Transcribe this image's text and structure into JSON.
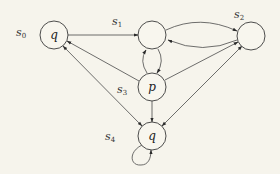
{
  "diagram": {
    "type": "kripke-structure",
    "states": [
      {
        "id": "s0",
        "label": "s0",
        "label_base": "s",
        "label_sub": "0",
        "prop": "q"
      },
      {
        "id": "s1",
        "label": "s1",
        "label_base": "s",
        "label_sub": "1",
        "prop": ""
      },
      {
        "id": "s2",
        "label": "s2",
        "label_base": "s",
        "label_sub": "2",
        "prop": ""
      },
      {
        "id": "s3",
        "label": "s3",
        "label_base": "s",
        "label_sub": "3",
        "prop": "p"
      },
      {
        "id": "s4",
        "label": "s4",
        "label_base": "s",
        "label_sub": "4",
        "prop": "q"
      }
    ],
    "transitions": [
      {
        "from": "s0",
        "to": "s1"
      },
      {
        "from": "s0",
        "to": "s4"
      },
      {
        "from": "s1",
        "to": "s2"
      },
      {
        "from": "s2",
        "to": "s1"
      },
      {
        "from": "s1",
        "to": "s3"
      },
      {
        "from": "s3",
        "to": "s1"
      },
      {
        "from": "s3",
        "to": "s0"
      },
      {
        "from": "s3",
        "to": "s2"
      },
      {
        "from": "s3",
        "to": "s4"
      },
      {
        "from": "s2",
        "to": "s4"
      },
      {
        "from": "s4",
        "to": "s4"
      }
    ]
  }
}
